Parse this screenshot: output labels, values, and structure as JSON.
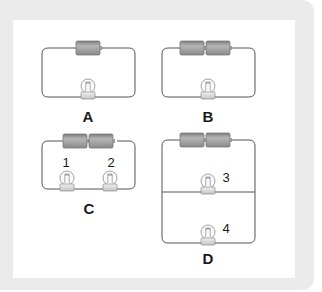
{
  "diagram": {
    "type": "circuit-diagrams",
    "circuits": [
      {
        "label": "A",
        "batteries": 1,
        "bulbs": [
          {
            "number": ""
          }
        ],
        "arrangement": "series"
      },
      {
        "label": "B",
        "batteries": 2,
        "bulbs": [
          {
            "number": ""
          }
        ],
        "arrangement": "series"
      },
      {
        "label": "C",
        "batteries": 2,
        "bulbs": [
          {
            "number": "1"
          },
          {
            "number": "2"
          }
        ],
        "arrangement": "series"
      },
      {
        "label": "D",
        "batteries": 2,
        "bulbs": [
          {
            "number": "3"
          },
          {
            "number": "4"
          }
        ],
        "arrangement": "parallel"
      }
    ]
  },
  "labels": {
    "a": "A",
    "b": "B",
    "c": "C",
    "d": "D",
    "bulb1": "1",
    "bulb2": "2",
    "bulb3": "3",
    "bulb4": "4"
  },
  "colors": {
    "background": "#ebebeb",
    "panel": "#ffffff",
    "wire": "#555555",
    "battery": "#9a9a9a",
    "bulb_base": "#d8d8d8"
  }
}
